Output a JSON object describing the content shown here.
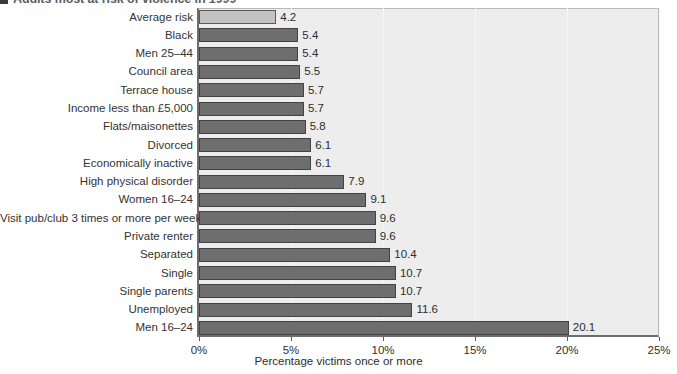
{
  "figure": {
    "caption": "Adults most at risk of violence in 1999",
    "bullet_icon": "square-bullet-icon"
  },
  "colors": {
    "bar_fill": "#6e6e6e",
    "bar_highlight_fill": "#c3c3c3",
    "bar_border": "#434343",
    "plot_background": "#ededed",
    "axis": "#6d6d6d"
  },
  "axis": {
    "x_title": "Percentage victims once or more",
    "x_ticks": [
      "0%",
      "5%",
      "10%",
      "15%",
      "20%",
      "25%"
    ]
  },
  "chart_data": {
    "type": "bar",
    "orientation": "horizontal",
    "title": "Adults most at risk of violence in 1999",
    "xlabel": "Percentage victims once or more",
    "ylabel": "",
    "xlim": [
      0,
      25
    ],
    "grid": true,
    "legend": "none",
    "categories": [
      "Average risk",
      "Black",
      "Men 25–44",
      "Council area",
      "Terrace house",
      "Income less than £5,000",
      "Flats/maisonettes",
      "Divorced",
      "Economically inactive",
      "High physical disorder",
      "Women 16–24",
      "Visit pub/club 3 times or more per week",
      "Private renter",
      "Separated",
      "Single",
      "Single parents",
      "Unemployed",
      "Men 16–24"
    ],
    "values": [
      4.2,
      5.4,
      5.4,
      5.5,
      5.7,
      5.7,
      5.8,
      6.1,
      6.1,
      7.9,
      9.1,
      9.6,
      9.6,
      10.4,
      10.7,
      10.7,
      11.6,
      20.1
    ],
    "value_labels": [
      "4.2",
      "5.4",
      "5.4",
      "5.5",
      "5.7",
      "5.7",
      "5.8",
      "6.1",
      "6.1",
      "7.9",
      "9.1",
      "9.6",
      "9.6",
      "10.4",
      "10.7",
      "10.7",
      "11.6",
      "20.1"
    ],
    "highlighted_index": 0,
    "tick_values": [
      0,
      5,
      10,
      15,
      20,
      25
    ],
    "tick_labels": [
      "0%",
      "5%",
      "10%",
      "15%",
      "20%",
      "25%"
    ]
  }
}
